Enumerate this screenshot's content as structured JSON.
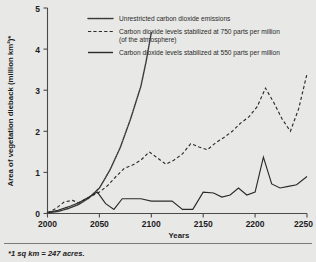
{
  "chart_data": {
    "type": "line",
    "title": "",
    "xlabel": "Years",
    "ylabel": "Area of vegetation dieback (million km2)*",
    "ylabel_display": "Area of vegetation dieback (million km²)*",
    "xlim": [
      2000,
      2250
    ],
    "ylim": [
      0,
      5
    ],
    "xticks": [
      2000,
      2050,
      2100,
      2150,
      2200,
      2250
    ],
    "xtick_labels": [
      "2000",
      "2050",
      "2100",
      "2150",
      "2200",
      "2250"
    ],
    "yticks": [
      0,
      1,
      2,
      3,
      4,
      5
    ],
    "ytick_labels": [
      "0",
      "1",
      "2",
      "3",
      "4",
      "5"
    ],
    "grid": false,
    "legend_position": "top-center",
    "footnote": "*1 sq km = 247 acres.",
    "series": [
      {
        "name": "Unrestricted carbon dioxide emissions",
        "style": "dotted",
        "legend_label": "Unrestricted carbon dioxide emissions",
        "x": [
          2000,
          2010,
          2020,
          2030,
          2040,
          2050,
          2060,
          2070,
          2080,
          2090,
          2095,
          2100
        ],
        "values": [
          0.02,
          0.05,
          0.12,
          0.22,
          0.38,
          0.62,
          1.05,
          1.6,
          2.3,
          3.1,
          3.7,
          4.4
        ]
      },
      {
        "name": "Carbon dioxide levels stabilized at 750 parts per million",
        "style": "dashed",
        "legend_label": "Carbon dioxide levels stabilized at 750 parts per million",
        "legend_label_line2": "(of the atmosphere)",
        "x": [
          2000,
          2008,
          2016,
          2024,
          2030,
          2036,
          2042,
          2050,
          2058,
          2066,
          2074,
          2082,
          2090,
          2098,
          2106,
          2114,
          2122,
          2130,
          2138,
          2146,
          2154,
          2162,
          2170,
          2178,
          2186,
          2194,
          2202,
          2210,
          2218,
          2226,
          2234,
          2242,
          2250
        ],
        "values": [
          0.02,
          0.12,
          0.28,
          0.32,
          0.26,
          0.34,
          0.42,
          0.52,
          0.68,
          0.9,
          1.1,
          1.18,
          1.3,
          1.5,
          1.35,
          1.2,
          1.3,
          1.45,
          1.7,
          1.62,
          1.55,
          1.72,
          1.85,
          2.0,
          2.2,
          2.35,
          2.6,
          3.05,
          2.7,
          2.3,
          2.0,
          2.55,
          3.4
        ]
      },
      {
        "name": "Carbon dioxide levels stabilized at 550 parts per million",
        "style": "solid",
        "legend_label": "Carbon dioxide levels stabilized at 550 parts per million",
        "x": [
          2000,
          2010,
          2020,
          2030,
          2040,
          2048,
          2056,
          2064,
          2072,
          2080,
          2090,
          2100,
          2110,
          2120,
          2130,
          2140,
          2150,
          2160,
          2168,
          2176,
          2184,
          2192,
          2200,
          2208,
          2216,
          2224,
          2232,
          2240,
          2250
        ],
        "values": [
          0.02,
          0.08,
          0.16,
          0.26,
          0.4,
          0.52,
          0.24,
          0.1,
          0.36,
          0.36,
          0.36,
          0.3,
          0.3,
          0.3,
          0.1,
          0.1,
          0.52,
          0.5,
          0.4,
          0.45,
          0.62,
          0.45,
          0.52,
          1.37,
          0.72,
          0.62,
          0.66,
          0.7,
          0.9
        ]
      }
    ]
  },
  "legend": {
    "items": [
      {
        "style": "dotted",
        "label": "Unrestricted carbon dioxide emissions",
        "label_line2": ""
      },
      {
        "style": "dashed",
        "label": "Carbon dioxide levels stabilized at 750 parts per million",
        "label_line2": "(of the atmosphere)"
      },
      {
        "style": "solid",
        "label": "Carbon dioxide levels stabilized at 550 parts per million",
        "label_line2": ""
      }
    ]
  },
  "colors": {
    "background": "#e8e8e6",
    "ink": "#1c1c1c",
    "line": "#2b2b2b",
    "axis": "#4a4a4a"
  }
}
